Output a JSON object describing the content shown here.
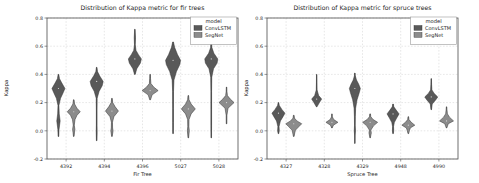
{
  "figure": {
    "background": "#ffffff",
    "width": 479,
    "height": 183
  },
  "chart_data": [
    {
      "type": "violin",
      "title": "Distribution of Kappa metric for fir trees",
      "xlabel": "Fir Tree",
      "ylabel": "Kappa",
      "ylim": [
        -0.2,
        0.8
      ],
      "yticks": [
        -0.2,
        0.0,
        0.2,
        0.4,
        0.6,
        0.8
      ],
      "grid": true,
      "legend_position": "upper right",
      "legend": {
        "title": "model",
        "entries": [
          "ConvLSTM",
          "SegNet"
        ]
      },
      "categories": [
        "4392",
        "4394",
        "4396",
        "5027",
        "5028"
      ],
      "series": [
        {
          "name": "ConvLSTM",
          "color": "#595959",
          "edge": "#303030",
          "violins": [
            {
              "w": 6.5,
              "profile": [
                [
                  -0.04,
                  0.05
                ],
                [
                  0.01,
                  0.09
                ],
                [
                  0.07,
                  0.26
                ],
                [
                  0.12,
                  0.12
                ],
                [
                  0.18,
                  0.07
                ],
                [
                  0.23,
                  0.32
                ],
                [
                  0.27,
                  0.72
                ],
                [
                  0.3,
                  1
                ],
                [
                  0.34,
                  0.5
                ],
                [
                  0.37,
                  0.16
                ],
                [
                  0.4,
                  0.05
                ]
              ]
            },
            {
              "w": 6.5,
              "profile": [
                [
                  -0.07,
                  0.04
                ],
                [
                  -0.01,
                  0.07
                ],
                [
                  0.04,
                  0.05
                ],
                [
                  0.14,
                  0.05
                ],
                [
                  0.23,
                  0.07
                ],
                [
                  0.28,
                  0.38
                ],
                [
                  0.32,
                  0.85
                ],
                [
                  0.35,
                  1
                ],
                [
                  0.39,
                  0.45
                ],
                [
                  0.42,
                  0.13
                ],
                [
                  0.45,
                  0.04
                ]
              ]
            },
            {
              "w": 6.5,
              "profile": [
                [
                  0.4,
                  0.05
                ],
                [
                  0.44,
                  0.3
                ],
                [
                  0.48,
                  0.85
                ],
                [
                  0.51,
                  1
                ],
                [
                  0.54,
                  0.55
                ],
                [
                  0.57,
                  0.18
                ],
                [
                  0.61,
                  0.06
                ],
                [
                  0.66,
                  0.1
                ],
                [
                  0.72,
                  0.03
                ]
              ]
            },
            {
              "w": 7.5,
              "profile": [
                [
                  -0.02,
                  0.04
                ],
                [
                  0.06,
                  0.05
                ],
                [
                  0.16,
                  0.05
                ],
                [
                  0.28,
                  0.06
                ],
                [
                  0.36,
                  0.12
                ],
                [
                  0.42,
                  0.45
                ],
                [
                  0.47,
                  0.9
                ],
                [
                  0.5,
                  1
                ],
                [
                  0.54,
                  0.6
                ],
                [
                  0.59,
                  0.22
                ],
                [
                  0.63,
                  0.05
                ]
              ]
            },
            {
              "w": 6.5,
              "profile": [
                [
                  -0.05,
                  0.04
                ],
                [
                  0.04,
                  0.05
                ],
                [
                  0.15,
                  0.05
                ],
                [
                  0.28,
                  0.05
                ],
                [
                  0.38,
                  0.08
                ],
                [
                  0.44,
                  0.35
                ],
                [
                  0.48,
                  0.9
                ],
                [
                  0.51,
                  1
                ],
                [
                  0.55,
                  0.4
                ],
                [
                  0.59,
                  0.1
                ],
                [
                  0.64,
                  0.04
                ]
              ]
            }
          ]
        },
        {
          "name": "SegNet",
          "color": "#8c8c8c",
          "edge": "#303030",
          "violins": [
            {
              "w": 6.5,
              "profile": [
                [
                  -0.04,
                  0.04
                ],
                [
                  -0.01,
                  0.12
                ],
                [
                  0.01,
                  0.18
                ],
                [
                  0.04,
                  0.08
                ],
                [
                  0.08,
                  0.2
                ],
                [
                  0.11,
                  0.5
                ],
                [
                  0.135,
                  1
                ],
                [
                  0.16,
                  0.5
                ],
                [
                  0.19,
                  0.13
                ],
                [
                  0.22,
                  0.04
                ]
              ]
            },
            {
              "w": 6.5,
              "profile": [
                [
                  -0.04,
                  0.04
                ],
                [
                  0.0,
                  0.18
                ],
                [
                  0.02,
                  0.1
                ],
                [
                  0.06,
                  0.08
                ],
                [
                  0.1,
                  0.3
                ],
                [
                  0.14,
                  1
                ],
                [
                  0.17,
                  0.5
                ],
                [
                  0.2,
                  0.12
                ],
                [
                  0.23,
                  0.04
                ]
              ]
            },
            {
              "w": 8.0,
              "profile": [
                [
                  0.22,
                  0.05
                ],
                [
                  0.255,
                  0.25
                ],
                [
                  0.285,
                  1
                ],
                [
                  0.31,
                  0.45
                ],
                [
                  0.335,
                  0.1
                ],
                [
                  0.37,
                  0.05
                ],
                [
                  0.4,
                  0.03
                ]
              ]
            },
            {
              "w": 7.0,
              "profile": [
                [
                  -0.05,
                  0.04
                ],
                [
                  0.0,
                  0.14
                ],
                [
                  0.03,
                  0.08
                ],
                [
                  0.08,
                  0.1
                ],
                [
                  0.12,
                  0.4
                ],
                [
                  0.155,
                  1
                ],
                [
                  0.19,
                  0.4
                ],
                [
                  0.22,
                  0.1
                ],
                [
                  0.25,
                  0.04
                ]
              ]
            },
            {
              "w": 7.5,
              "profile": [
                [
                  0.05,
                  0.04
                ],
                [
                  0.11,
                  0.05
                ],
                [
                  0.16,
                  0.2
                ],
                [
                  0.2,
                  1
                ],
                [
                  0.225,
                  0.5
                ],
                [
                  0.25,
                  0.12
                ],
                [
                  0.28,
                  0.05
                ],
                [
                  0.31,
                  0.03
                ]
              ]
            }
          ]
        }
      ]
    },
    {
      "type": "violin",
      "title": "Distribution of Kappa metric for spruce trees",
      "xlabel": "Spruce Tree",
      "ylabel": "Kappa",
      "ylim": [
        -0.2,
        0.8
      ],
      "yticks": [
        -0.2,
        0.0,
        0.2,
        0.4,
        0.6,
        0.8
      ],
      "grid": true,
      "legend_position": "upper right",
      "legend": {
        "title": "model",
        "entries": [
          "ConvLSTM",
          "SegNet"
        ]
      },
      "categories": [
        "4327",
        "4328",
        "4329",
        "4948",
        "4990"
      ],
      "series": [
        {
          "name": "ConvLSTM",
          "color": "#595959",
          "edge": "#303030",
          "violins": [
            {
              "w": 6.5,
              "profile": [
                [
                  -0.02,
                  0.05
                ],
                [
                  0.0,
                  0.13
                ],
                [
                  0.03,
                  0.09
                ],
                [
                  0.07,
                  0.3
                ],
                [
                  0.1,
                  0.7
                ],
                [
                  0.125,
                  1
                ],
                [
                  0.15,
                  0.55
                ],
                [
                  0.18,
                  0.13
                ],
                [
                  0.2,
                  0.04
                ]
              ]
            },
            {
              "w": 5.0,
              "profile": [
                [
                  0.17,
                  0.06
                ],
                [
                  0.2,
                  0.55
                ],
                [
                  0.225,
                  1
                ],
                [
                  0.25,
                  0.4
                ],
                [
                  0.29,
                  0.08
                ],
                [
                  0.34,
                  0.05
                ],
                [
                  0.4,
                  0.03
                ]
              ]
            },
            {
              "w": 5.5,
              "profile": [
                [
                  -0.09,
                  0.03
                ],
                [
                  -0.03,
                  0.05
                ],
                [
                  0.0,
                  0.11
                ],
                [
                  0.04,
                  0.06
                ],
                [
                  0.1,
                  0.08
                ],
                [
                  0.16,
                  0.14
                ],
                [
                  0.22,
                  0.4
                ],
                [
                  0.27,
                  0.8
                ],
                [
                  0.3,
                  1
                ],
                [
                  0.33,
                  0.7
                ],
                [
                  0.36,
                  0.3
                ],
                [
                  0.39,
                  0.08
                ],
                [
                  0.41,
                  0.03
                ]
              ]
            },
            {
              "w": 6.0,
              "profile": [
                [
                  -0.02,
                  0.05
                ],
                [
                  0.0,
                  0.11
                ],
                [
                  0.03,
                  0.08
                ],
                [
                  0.06,
                  0.22
                ],
                [
                  0.09,
                  0.6
                ],
                [
                  0.12,
                  1
                ],
                [
                  0.145,
                  0.55
                ],
                [
                  0.17,
                  0.13
                ],
                [
                  0.19,
                  0.04
                ]
              ]
            },
            {
              "w": 6.5,
              "profile": [
                [
                  0.15,
                  0.04
                ],
                [
                  0.19,
                  0.15
                ],
                [
                  0.22,
                  0.7
                ],
                [
                  0.24,
                  1
                ],
                [
                  0.265,
                  0.45
                ],
                [
                  0.29,
                  0.1
                ],
                [
                  0.33,
                  0.05
                ],
                [
                  0.37,
                  0.03
                ]
              ]
            }
          ]
        },
        {
          "name": "SegNet",
          "color": "#8c8c8c",
          "edge": "#303030",
          "violins": [
            {
              "w": 8.0,
              "profile": [
                [
                  -0.04,
                  0.04
                ],
                [
                  -0.015,
                  0.13
                ],
                [
                  0.005,
                  0.22
                ],
                [
                  0.03,
                  0.65
                ],
                [
                  0.05,
                  1
                ],
                [
                  0.07,
                  0.4
                ],
                [
                  0.09,
                  0.09
                ],
                [
                  0.11,
                  0.04
                ]
              ]
            },
            {
              "w": 6.0,
              "profile": [
                [
                  0.02,
                  0.04
                ],
                [
                  0.04,
                  0.25
                ],
                [
                  0.06,
                  1
                ],
                [
                  0.08,
                  0.3
                ],
                [
                  0.1,
                  0.06
                ],
                [
                  0.12,
                  0.03
                ]
              ]
            },
            {
              "w": 7.5,
              "profile": [
                [
                  -0.05,
                  0.03
                ],
                [
                  -0.015,
                  0.16
                ],
                [
                  0.005,
                  0.1
                ],
                [
                  0.035,
                  0.45
                ],
                [
                  0.06,
                  1
                ],
                [
                  0.08,
                  0.4
                ],
                [
                  0.1,
                  0.09
                ],
                [
                  0.12,
                  0.04
                ]
              ]
            },
            {
              "w": 6.5,
              "profile": [
                [
                  -0.02,
                  0.05
                ],
                [
                  0.0,
                  0.16
                ],
                [
                  0.02,
                  0.3
                ],
                [
                  0.04,
                  1
                ],
                [
                  0.06,
                  0.45
                ],
                [
                  0.08,
                  0.1
                ],
                [
                  0.1,
                  0.04
                ]
              ]
            },
            {
              "w": 7.0,
              "profile": [
                [
                  0.02,
                  0.04
                ],
                [
                  0.05,
                  0.25
                ],
                [
                  0.07,
                  1
                ],
                [
                  0.095,
                  0.45
                ],
                [
                  0.12,
                  0.13
                ],
                [
                  0.15,
                  0.06
                ],
                [
                  0.17,
                  0.03
                ]
              ]
            }
          ]
        }
      ]
    }
  ]
}
